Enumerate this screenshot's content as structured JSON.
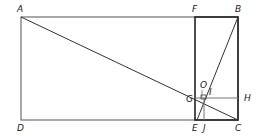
{
  "diagram": {
    "type": "geometric-construction",
    "stroke_color": "#333333",
    "light_stroke_color": "#777777",
    "points": {
      "A": {
        "label": "A",
        "x": 21,
        "y": 17
      },
      "F": {
        "label": "F",
        "x": 195,
        "y": 17
      },
      "B": {
        "label": "B",
        "x": 238,
        "y": 17
      },
      "D": {
        "label": "D",
        "x": 21,
        "y": 120
      },
      "E": {
        "label": "E",
        "x": 195,
        "y": 120
      },
      "J": {
        "label": "J",
        "x": 204,
        "y": 120
      },
      "C": {
        "label": "C",
        "x": 238,
        "y": 120
      },
      "G": {
        "label": "G",
        "x": 195,
        "y": 98
      },
      "H": {
        "label": "H",
        "x": 238,
        "y": 98
      },
      "O": {
        "label": "O",
        "x": 203,
        "y": 92
      },
      "I": {
        "label": "I",
        "x": 206,
        "y": 96
      }
    },
    "labels": {
      "A": "A",
      "B": "B",
      "C": "C",
      "D": "D",
      "E": "E",
      "F": "F",
      "G": "G",
      "H": "H",
      "I": "I",
      "J": "J",
      "O": "O"
    },
    "segments": [
      "A-B",
      "B-C",
      "C-D",
      "D-A",
      "F-E",
      "A-C",
      "B-E",
      "G-H",
      "J-I"
    ]
  }
}
